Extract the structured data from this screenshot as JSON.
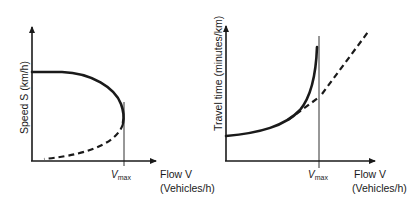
{
  "diagrams": [
    {
      "id": "speed-flow",
      "y_axis_label": "Speed S (km/h)",
      "x_axis_label_line1": "Flow V",
      "x_axis_label_line2": "(Vehicles/h)",
      "vmax_label_main": "V",
      "vmax_label_sub": "max",
      "curves": [
        {
          "style": "solid",
          "description": "uncongested branch: speed falls from free-flow speed toward Vmax"
        },
        {
          "style": "dashed",
          "description": "congested branch: speed and flow both drop below Vmax"
        }
      ]
    },
    {
      "id": "traveltime-flow",
      "y_axis_label": "Travel time (minutes/km)",
      "x_axis_label_line1": "Flow V",
      "x_axis_label_line2": "(Vehicles/h)",
      "vmax_label_main": "V",
      "vmax_label_sub": "max",
      "curves": [
        {
          "style": "solid",
          "description": "travel time rises asymptotically approaching Vmax"
        },
        {
          "style": "dashed",
          "description": "linearized travel-time function extending beyond Vmax"
        }
      ]
    }
  ],
  "colors": {
    "ink": "#1a1a1a",
    "background": "#ffffff"
  }
}
